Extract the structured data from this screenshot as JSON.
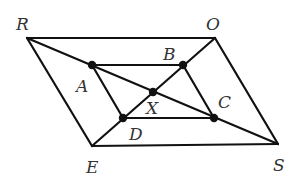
{
  "diagram": {
    "type": "geometry",
    "colors": {
      "line": "#111111",
      "text": "#333333",
      "background": "#ffffff"
    },
    "points": {
      "R": {
        "label": "R",
        "x": 27,
        "y": 38,
        "lx": 16,
        "ly": 30
      },
      "O": {
        "label": "O",
        "x": 215,
        "y": 38,
        "lx": 206,
        "ly": 30
      },
      "S": {
        "label": "S",
        "x": 278,
        "y": 144,
        "lx": 273,
        "ly": 171
      },
      "E": {
        "label": "E",
        "x": 92,
        "y": 146,
        "lx": 86,
        "ly": 173
      },
      "A": {
        "label": "A",
        "x": 92,
        "y": 65,
        "lx": 76,
        "ly": 92
      },
      "B": {
        "label": "B",
        "x": 183,
        "y": 65,
        "lx": 163,
        "ly": 60
      },
      "C": {
        "label": "C",
        "x": 214,
        "y": 118,
        "lx": 218,
        "ly": 108
      },
      "D": {
        "label": "D",
        "x": 123,
        "y": 118,
        "lx": 129,
        "ly": 140
      },
      "X": {
        "label": "X",
        "x": 153,
        "y": 92,
        "lx": 146,
        "ly": 114
      }
    },
    "segments": [
      [
        "R",
        "O"
      ],
      [
        "O",
        "S"
      ],
      [
        "S",
        "E"
      ],
      [
        "E",
        "R"
      ],
      [
        "R",
        "S"
      ],
      [
        "O",
        "E"
      ],
      [
        "A",
        "B"
      ],
      [
        "B",
        "C"
      ],
      [
        "C",
        "D"
      ],
      [
        "D",
        "A"
      ]
    ],
    "dots": [
      "A",
      "B",
      "C",
      "D",
      "X"
    ]
  }
}
